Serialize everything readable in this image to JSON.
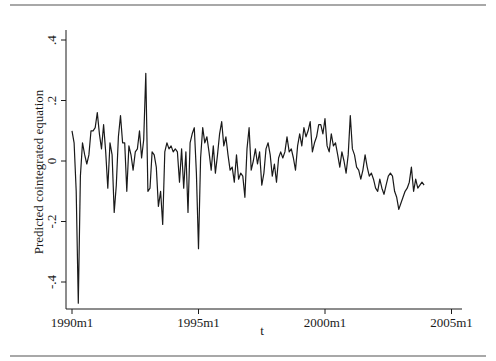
{
  "chart_data": {
    "type": "line",
    "title": "",
    "xlabel": "t",
    "ylabel": "Predicted cointegrated equation",
    "ylim": [
      -0.45,
      0.42
    ],
    "yticks": [
      -0.4,
      -0.2,
      0,
      0.2,
      0.4
    ],
    "ytick_labels": [
      "-.4",
      "-.2",
      "0",
      ".2",
      ".4"
    ],
    "xticks": [
      "1990m1",
      "1995m1",
      "2000m1",
      "2005m1"
    ],
    "xtick_years": [
      1990,
      1995,
      2000,
      2005
    ],
    "grid": false,
    "legend": null,
    "line_color": "#1a1a1a",
    "x_start": "1990m1",
    "x_end": "2003m12",
    "frequency": "monthly",
    "series": [
      {
        "name": "Predicted cointegrated equation",
        "values": [
          0.1,
          0.06,
          -0.1,
          -0.47,
          -0.05,
          0.06,
          0.02,
          -0.01,
          0.02,
          0.1,
          0.1,
          0.11,
          0.16,
          0.09,
          0.04,
          0.12,
          0.03,
          -0.09,
          0.06,
          0.02,
          -0.17,
          -0.08,
          0.08,
          0.15,
          0.06,
          0.06,
          -0.1,
          0.05,
          0.02,
          -0.03,
          0.03,
          0.04,
          0.1,
          0.01,
          0.07,
          0.29,
          -0.1,
          -0.09,
          0.03,
          0.02,
          -0.02,
          -0.15,
          -0.1,
          -0.21,
          0.03,
          0.06,
          0.04,
          0.05,
          0.03,
          0.04,
          0.03,
          -0.07,
          0.04,
          -0.09,
          0.03,
          -0.17,
          0.06,
          0.09,
          0.11,
          -0.04,
          -0.29,
          0.01,
          0.11,
          0.06,
          0.08,
          0.03,
          -0.03,
          0.05,
          -0.04,
          0.02,
          0.09,
          0.13,
          0.05,
          0.08,
          0.02,
          -0.03,
          -0.02,
          -0.07,
          0.02,
          -0.06,
          -0.04,
          -0.05,
          -0.12,
          0.04,
          0.11,
          -0.03,
          0.0,
          0.04,
          -0.01,
          0.03,
          -0.08,
          -0.04,
          0.04,
          0.06,
          0.02,
          -0.05,
          -0.01,
          -0.07,
          0.01,
          0.03,
          0.01,
          0.03,
          0.08,
          0.03,
          0.04,
          0.01,
          -0.03,
          0.05,
          0.09,
          0.05,
          0.11,
          0.08,
          0.1,
          0.13,
          0.03,
          0.06,
          0.08,
          0.12,
          0.12,
          0.09,
          0.14,
          0.05,
          0.03,
          0.09,
          0.05,
          0.06,
          0.02,
          -0.02,
          0.03,
          0.0,
          -0.04,
          0.02,
          0.15,
          0.04,
          0.02,
          -0.02,
          -0.03,
          -0.06,
          -0.03,
          0.02,
          -0.02,
          -0.05,
          -0.04,
          -0.06,
          -0.09,
          -0.1,
          -0.06,
          -0.09,
          -0.11,
          -0.08,
          -0.05,
          -0.04,
          -0.05,
          -0.1,
          -0.12,
          -0.16,
          -0.14,
          -0.12,
          -0.1,
          -0.09,
          -0.07,
          -0.02,
          -0.1,
          -0.06,
          -0.09,
          -0.08,
          -0.07,
          -0.08
        ]
      }
    ]
  }
}
